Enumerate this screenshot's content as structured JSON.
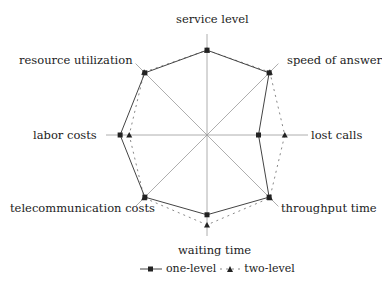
{
  "chart_data": {
    "type": "radar",
    "title": "",
    "axes": [
      "service level",
      "speed of answer",
      "lost calls",
      "throughput time",
      "waiting time",
      "telecommunication costs",
      "labor costs",
      "resource utilization"
    ],
    "range": [
      0,
      100
    ],
    "grid": false,
    "legend_position": "bottom",
    "series": [
      {
        "name": "one-level",
        "marker": "square",
        "line": "solid",
        "values": [
          84,
          87,
          51,
          87,
          79,
          87,
          86,
          87
        ]
      },
      {
        "name": "two-level",
        "marker": "triangle",
        "line": "dashed",
        "values": [
          84,
          88,
          77,
          88,
          89,
          88,
          77,
          88
        ]
      }
    ]
  },
  "labels": {
    "service_level": "service level",
    "speed_of_answer": "speed of answer",
    "lost_calls": "lost calls",
    "throughput_time": "throughput time",
    "waiting_time": "waiting time",
    "telecommunication_costs": "telecommunication costs",
    "labor_costs": "labor costs",
    "resource_utilization": "resource utilization"
  },
  "legend": {
    "one_level": "one-level",
    "two_level": "two-level"
  },
  "colors": {
    "axis": "#999999",
    "one_level": "#333333",
    "two_level": "#777777"
  }
}
